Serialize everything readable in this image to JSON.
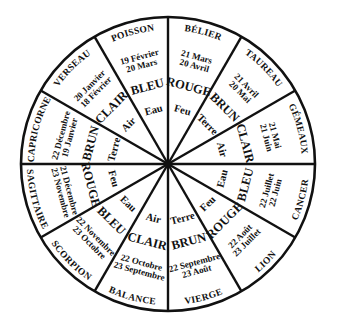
{
  "diagram": {
    "title": "",
    "type": "zodiac-wheel",
    "center": [
      168,
      164
    ],
    "radius": 147,
    "stroke_color": "#111111",
    "background": "#ffffff"
  },
  "signs": [
    {
      "name": "BÉLIER",
      "dates": [
        "21 Mars",
        "20 Avril"
      ],
      "color": "ROUGE",
      "element": "Feu"
    },
    {
      "name": "TAUREAU",
      "dates": [
        "21 Avril",
        "20 Mai"
      ],
      "color": "BRUN",
      "element": "Terre"
    },
    {
      "name": "GÉMEAUX",
      "dates": [
        "21 Mai",
        "21 Juin"
      ],
      "color": "CLAIR",
      "element": "Air"
    },
    {
      "name": "CANCER",
      "dates": [
        "22 Juin",
        "22 Juillet"
      ],
      "color": "BLEU",
      "element": "Eau"
    },
    {
      "name": "LION",
      "dates": [
        "23 Juillet",
        "22 Août"
      ],
      "color": "ROUGE",
      "element": "Feu"
    },
    {
      "name": "VIERGE",
      "dates": [
        "23 Août",
        "22 Septembre"
      ],
      "color": "BRUN",
      "element": "Terre"
    },
    {
      "name": "BALANCE",
      "dates": [
        "23 Septembre",
        "22 Octobre"
      ],
      "color": "CLAIR",
      "element": "Air"
    },
    {
      "name": "SCORPION",
      "dates": [
        "23 Octobre",
        "22 Novembre"
      ],
      "color": "BLEU",
      "element": "Eau"
    },
    {
      "name": "SAGITTAIRE",
      "dates": [
        "23 Novembre",
        "21 Décembre"
      ],
      "color": "ROUGE",
      "element": "Feu"
    },
    {
      "name": "CAPRICORNE",
      "dates": [
        "22 Décembre",
        "19 Janvier"
      ],
      "color": "BRUN",
      "element": "Terre"
    },
    {
      "name": "VERSEAU",
      "dates": [
        "20 Janvier",
        "18 Février"
      ],
      "color": "CLAIR",
      "element": "Air"
    },
    {
      "name": "POISSON",
      "dates": [
        "19 Février",
        "20 Mars"
      ],
      "color": "BLEU",
      "element": "Eau"
    }
  ]
}
